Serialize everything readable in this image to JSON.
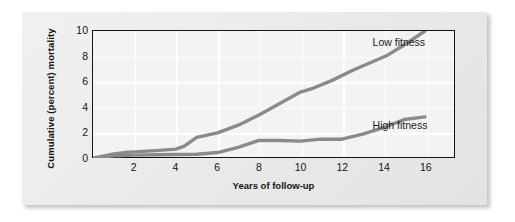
{
  "figure": {
    "background_color": "#ffffff",
    "card_color": "#e9e9e9",
    "plot_background_color": "#f3f3f3",
    "grid_color": "#ffffff",
    "axis_color": "#141414",
    "series_color": "#8a8a8a"
  },
  "chart_data": {
    "type": "line",
    "title": "",
    "xlabel": "Years of follow-up",
    "ylabel": "Cumulative (percent) mortality",
    "xlim": [
      0,
      17.4
    ],
    "ylim": [
      0,
      10
    ],
    "xticks": [
      2,
      4,
      6,
      8,
      10,
      12,
      14,
      16
    ],
    "yticks": [
      0,
      2,
      4,
      6,
      8,
      10
    ],
    "grid": true,
    "legend_position": "inline-right",
    "series": [
      {
        "name": "Low fitness",
        "color": "#8a8a8a",
        "label_x": 13.4,
        "label_y": 9.1,
        "x": [
          0,
          1,
          1.5,
          2,
          3,
          4,
          4.4,
          5,
          6,
          7,
          8,
          9,
          10,
          10.6,
          11.5,
          12.5,
          13.5,
          14.2,
          15,
          16
        ],
        "y": [
          0,
          0.35,
          0.45,
          0.5,
          0.6,
          0.72,
          0.95,
          1.65,
          2.0,
          2.6,
          3.4,
          4.3,
          5.2,
          5.5,
          6.1,
          6.9,
          7.6,
          8.1,
          8.9,
          10.0
        ]
      },
      {
        "name": "High fitness",
        "color": "#8a8a8a",
        "label_x": 13.4,
        "label_y": 2.55,
        "x": [
          0,
          1,
          2,
          3,
          4,
          5,
          6,
          7,
          8,
          9,
          10,
          11,
          12,
          13,
          14,
          15,
          16
        ],
        "y": [
          0,
          0.2,
          0.25,
          0.28,
          0.3,
          0.32,
          0.45,
          0.85,
          1.4,
          1.4,
          1.35,
          1.5,
          1.5,
          1.9,
          2.4,
          3.05,
          3.25
        ]
      }
    ]
  }
}
